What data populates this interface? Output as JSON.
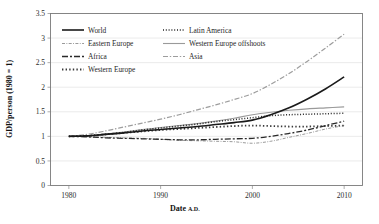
{
  "chart_data": {
    "type": "line",
    "title": "",
    "xlabel": "Date A.D.",
    "xlabel_main": "Date",
    "xlabel_suffix": "A.D.",
    "ylabel": "GDP/person (1980 = 1)",
    "xlim": [
      1978,
      2012
    ],
    "ylim": [
      0,
      3.5
    ],
    "grid": true,
    "grid_axis": "y",
    "legend_position": "top-left-inside",
    "xticks": [
      1980,
      1990,
      2000,
      2010
    ],
    "xtick_labels": [
      "1980",
      "1990",
      "2000",
      "2010"
    ],
    "yticks": [
      0,
      0.5,
      1,
      1.5,
      2,
      2.5,
      3,
      3.5
    ],
    "ytick_labels": [
      "0",
      "0.5",
      "1",
      "1.5",
      "2",
      "2.5",
      "3",
      "3.5"
    ],
    "x": [
      1980,
      1982,
      1984,
      1986,
      1988,
      1990,
      1992,
      1994,
      1996,
      1998,
      2000,
      2002,
      2004,
      2006,
      2008,
      2010
    ],
    "series": [
      {
        "name": "World",
        "style": "solid",
        "color": "#1a1a1a",
        "width": 1.6,
        "dash": "none",
        "values": [
          1.0,
          1.01,
          1.04,
          1.07,
          1.11,
          1.14,
          1.17,
          1.2,
          1.24,
          1.28,
          1.33,
          1.44,
          1.58,
          1.76,
          1.97,
          2.21
        ]
      },
      {
        "name": "Latin America",
        "style": "dotted",
        "color": "#222222",
        "width": 1.5,
        "dash": "1,1.8",
        "values": [
          1.0,
          1.01,
          1.04,
          1.08,
          1.13,
          1.17,
          1.21,
          1.25,
          1.3,
          1.34,
          1.38,
          1.42,
          1.44,
          1.45,
          1.46,
          1.47
        ]
      },
      {
        "name": "Eastern Europe",
        "style": "dash-dot-fine",
        "color": "#8e8e8e",
        "width": 0.9,
        "dash": "3,1.4,0.9,1.4",
        "values": [
          1.0,
          0.99,
          0.98,
          0.97,
          0.96,
          0.94,
          0.92,
          0.91,
          0.9,
          0.89,
          0.86,
          0.9,
          0.98,
          1.06,
          1.15,
          1.22
        ]
      },
      {
        "name": "Western Europe offshoots",
        "style": "solid-thin",
        "color": "#9a9a9a",
        "width": 1.1,
        "dash": "none",
        "values": [
          1.0,
          1.01,
          1.05,
          1.09,
          1.14,
          1.18,
          1.22,
          1.26,
          1.31,
          1.37,
          1.44,
          1.49,
          1.53,
          1.56,
          1.58,
          1.6
        ]
      },
      {
        "name": "Africa",
        "style": "long-dash-dot",
        "color": "#2a2a2a",
        "width": 1.3,
        "dash": "6,2,2,2",
        "values": [
          1.0,
          0.99,
          0.97,
          0.96,
          0.95,
          0.94,
          0.93,
          0.93,
          0.94,
          0.95,
          0.96,
          1.0,
          1.06,
          1.13,
          1.22,
          1.31
        ]
      },
      {
        "name": "Asia",
        "style": "dash-dot-gray",
        "color": "#9d9d9d",
        "width": 1.2,
        "dash": "5,1.8,1.4,1.8",
        "values": [
          1.0,
          1.04,
          1.11,
          1.19,
          1.27,
          1.35,
          1.44,
          1.54,
          1.64,
          1.75,
          1.87,
          2.06,
          2.28,
          2.53,
          2.8,
          3.08
        ]
      },
      {
        "name": "Western Europe",
        "style": "square-dotted",
        "color": "#3a3a3a",
        "width": 1.8,
        "dash": "1.4,2.2",
        "values": [
          1.0,
          1.01,
          1.04,
          1.07,
          1.1,
          1.13,
          1.15,
          1.17,
          1.19,
          1.21,
          1.22,
          1.21,
          1.2,
          1.2,
          1.21,
          1.22
        ]
      }
    ],
    "legend_entries": [
      {
        "label": "World",
        "series": "World",
        "col": 0,
        "row": 0
      },
      {
        "label": "Latin America",
        "series": "Latin America",
        "col": 1,
        "row": 0
      },
      {
        "label": "Eastern Europe",
        "series": "Eastern Europe",
        "col": 0,
        "row": 1
      },
      {
        "label": "Western Europe offshoots",
        "series": "Western Europe offshoots",
        "col": 1,
        "row": 1
      },
      {
        "label": "Africa",
        "series": "Africa",
        "col": 0,
        "row": 2
      },
      {
        "label": "Asia",
        "series": "Asia",
        "col": 1,
        "row": 2
      },
      {
        "label": "Western Europe",
        "series": "Western Europe",
        "col": 0,
        "row": 3
      }
    ]
  }
}
